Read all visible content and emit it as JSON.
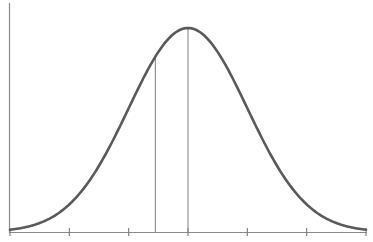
{
  "chart_data": {
    "type": "line",
    "title": "",
    "xlabel": "",
    "ylabel": "",
    "distribution": {
      "mean": 0,
      "sd": 1
    },
    "x_range": [
      -3,
      3
    ],
    "y_range": [
      0,
      0.4
    ],
    "x_ticks": [
      -3,
      -2,
      -1,
      0,
      1,
      2,
      3
    ],
    "x_tick_labels": [],
    "y_ticks": [],
    "vertical_lines": [
      {
        "x": -0.55,
        "label": ""
      },
      {
        "x": 0,
        "label": "mean"
      }
    ],
    "series": [
      {
        "name": "normal density",
        "x": [
          -3,
          -2.5,
          -2,
          -1.5,
          -1,
          -0.5,
          0,
          0.5,
          1,
          1.5,
          2,
          2.5,
          3
        ],
        "values": [
          0.0044,
          0.0175,
          0.054,
          0.1295,
          0.242,
          0.3521,
          0.3989,
          0.3521,
          0.242,
          0.1295,
          0.054,
          0.0175,
          0.0044
        ]
      }
    ],
    "grid": false,
    "legend": null,
    "colors": {
      "curve": "#5a5a5a",
      "axis": "#7a7a7a",
      "markers": "#8a8a8a"
    }
  }
}
